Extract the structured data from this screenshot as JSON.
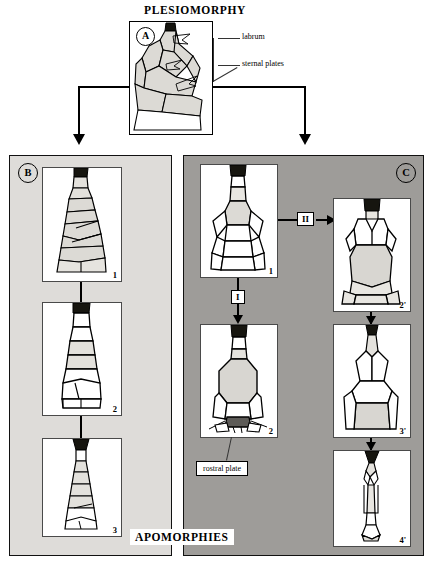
{
  "figure": {
    "top_title": "PLESIOMORPHY",
    "bottom_title": "APOMORPHIES"
  },
  "panel_a": {
    "tag": "A",
    "callouts": [
      {
        "name": "labrum",
        "label": "labrum"
      },
      {
        "name": "sternal-plates",
        "label": "sternal plates"
      }
    ]
  },
  "panel_b": {
    "tag": "B",
    "shading": "#dedcd9",
    "specimens": [
      {
        "number": "1"
      },
      {
        "number": "2"
      },
      {
        "number": "3"
      }
    ]
  },
  "panel_c": {
    "tag": "C",
    "shading": "#9e9c99",
    "specimens": [
      {
        "number": "1"
      },
      {
        "number": "2"
      },
      {
        "number": "2'"
      },
      {
        "number": "3'"
      },
      {
        "number": "4'"
      }
    ],
    "transitions": [
      {
        "name": "transition-one",
        "label": "I"
      },
      {
        "name": "transition-two",
        "label": "II"
      }
    ],
    "callouts": [
      {
        "name": "rostral-plate",
        "label": "rostral plate"
      }
    ]
  },
  "colors": {
    "ink": "#000000",
    "plate_fill": "#d9d7d2",
    "dark_plate": "#5d5b57",
    "panel_b_bg": "#dedcd9",
    "panel_c_bg": "#9e9c99",
    "frame_white": "#ffffff"
  }
}
